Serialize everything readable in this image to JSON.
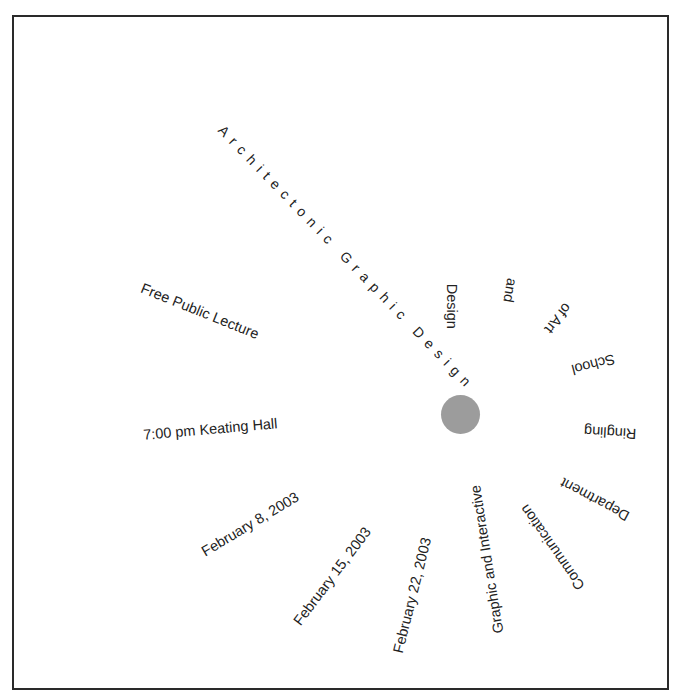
{
  "poster": {
    "title": "Architectonic Graphic Design",
    "event_type": "Free Public Lecture",
    "time_location": "7:00 pm Keating Hall",
    "dates": [
      "February 8, 2003",
      "February 15, 2003",
      "February 22, 2003"
    ],
    "host_words": [
      "Graphic and Interactive",
      "Communication",
      "Department",
      "Ringling",
      "School",
      "of Art",
      "and",
      "Design"
    ],
    "colors": {
      "dot": "#9c9c9c",
      "border": "#2a2a2a",
      "text": "#222222"
    }
  }
}
